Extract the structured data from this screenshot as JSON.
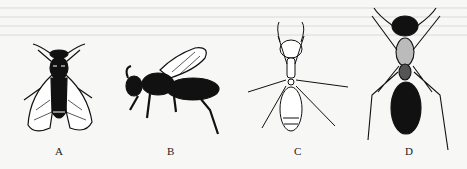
{
  "figure": {
    "panels": [
      {
        "label": "A",
        "subject": "winged insect, dorsal view (fly-like, dark body, two veined wings)"
      },
      {
        "label": "B",
        "subject": "bee, lateral view (dark body, one veined wing)"
      },
      {
        "label": "C",
        "subject": "ant, dorsal view (light-colored, slender)"
      },
      {
        "label": "D",
        "subject": "ant, dorsal view (dark, large abdomen)"
      }
    ]
  },
  "colors": {
    "background": "#f7f7f5",
    "ink": "#111111"
  }
}
